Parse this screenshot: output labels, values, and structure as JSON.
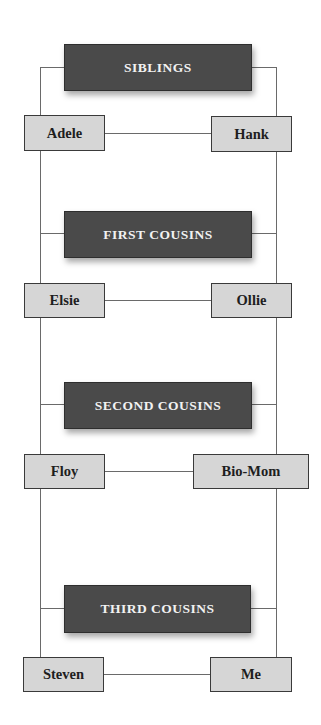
{
  "diagram": {
    "type": "cousin-relationship-ladder",
    "levels": [
      {
        "category": "SIBLINGS",
        "left": "Adele",
        "right": "Hank"
      },
      {
        "category": "FIRST COUSINS",
        "left": "Elsie",
        "right": "Ollie"
      },
      {
        "category": "SECOND COUSINS",
        "left": "Floy",
        "right": "Bio-Mom"
      },
      {
        "category": "THIRD COUSINS",
        "left": "Steven",
        "right": "Me"
      }
    ],
    "colors": {
      "category_fill": "#4a4a4a",
      "category_text": "#f2f2f2",
      "person_fill": "#d6d6d6",
      "person_text": "#1e1e1e",
      "connector": "#6a6a6a"
    }
  }
}
